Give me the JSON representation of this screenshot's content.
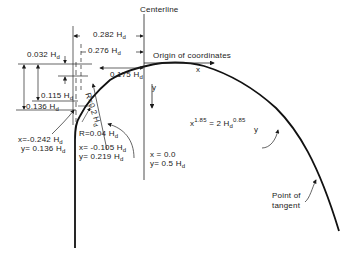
{
  "diagram": {
    "labels": {
      "centerline": "Centerline",
      "origin": "Origin of coordinates",
      "x_axis": "x",
      "y_axis": "y",
      "dim_0282": "0.282 H",
      "dim_0276": "0.276 H",
      "dim_0175": "0.175 H",
      "dim_0032": "0.032 H",
      "dim_0115": "0.115 H",
      "dim_0136": "0.136 H",
      "radius_02": "R=0.2 H",
      "radius_004": "R=0.04 H",
      "pt1_x": "x=-0.242 H",
      "pt1_y": "y= 0.136 H",
      "pt2_x": "x= -0.105 H",
      "pt2_y": "y= 0.219 H",
      "pt3_x": "x = 0.0",
      "pt3_y": "y= 0.5 H",
      "equation_lhs": "x",
      "equation_lhs_exp": "1.85",
      "equation_rhs": "= 2 H",
      "equation_rhs_exp": "0.85",
      "equation_y": "y",
      "point_of_tangent_1": "Point of",
      "point_of_tangent_2": "tangent",
      "subscript_d": "d"
    }
  }
}
